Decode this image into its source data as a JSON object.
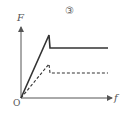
{
  "diagram": {
    "title": "③",
    "y_axis_label": "F",
    "x_axis_label": "f",
    "origin_label": "O",
    "colors": {
      "line": "#333333",
      "axis": "#555555",
      "text": "#555555"
    },
    "series": [
      {
        "name": "solid",
        "style": "solid",
        "points": [
          [
            21,
            98
          ],
          [
            49,
            35
          ],
          [
            50,
            48
          ],
          [
            108,
            48
          ]
        ]
      },
      {
        "name": "dashed",
        "style": "dashed",
        "points": [
          [
            21,
            98
          ],
          [
            49,
            64
          ],
          [
            50,
            73
          ],
          [
            108,
            73
          ]
        ]
      }
    ]
  }
}
